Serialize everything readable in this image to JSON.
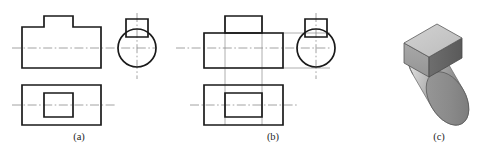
{
  "figure": {
    "background_color": "#ffffff",
    "line_color": "#1a1a1a",
    "centerline_color": "#8b8b8b",
    "projection_line_color": "#9a9a9a"
  },
  "panels": [
    {
      "id": "panel-a",
      "caption": "(a)",
      "caption_x": 79,
      "caption_y": 139,
      "views": [
        {
          "name": "front-view",
          "type": "outline",
          "shape": "stepped-rectangle-with-raised-boss"
        },
        {
          "name": "left-side-view",
          "type": "circle-with-boss",
          "shape": "circle topped by small rectangle"
        },
        {
          "name": "top-view",
          "type": "rectangle-with-inner-rectangle",
          "shape": "outer rectangle containing centered inner rectangle"
        }
      ]
    },
    {
      "id": "panel-b",
      "caption": "(b)",
      "caption_x": 273,
      "caption_y": 139,
      "views": [
        {
          "name": "front-view",
          "type": "outline",
          "shape": "rectangle with separate full boss rectangle on top"
        },
        {
          "name": "left-side-view",
          "type": "circle-with-boss",
          "shape": "circle topped by small rectangle"
        },
        {
          "name": "top-view",
          "type": "rectangle-with-inner-rectangle",
          "shape": "outer rectangle containing centered inner rectangle"
        }
      ],
      "has_projection_lines": true
    },
    {
      "id": "panel-c",
      "caption": "(c)",
      "caption_x": 439,
      "caption_y": 139,
      "views": [
        {
          "name": "isometric-pictorial",
          "type": "shaded-solid",
          "shape": "horizontal cylinder with rectangular boss block on top"
        }
      ],
      "shading": {
        "cylinder_end_face": "#8e8e8e",
        "cylinder_body_light": "#d6d6d6",
        "cylinder_body_mid": "#a9a9a9",
        "cylinder_body_dark": "#7c7c7c",
        "block_top_face": "#c9c9c9",
        "block_front_face": "#9e9e9e",
        "block_right_face": "#636363"
      }
    }
  ]
}
